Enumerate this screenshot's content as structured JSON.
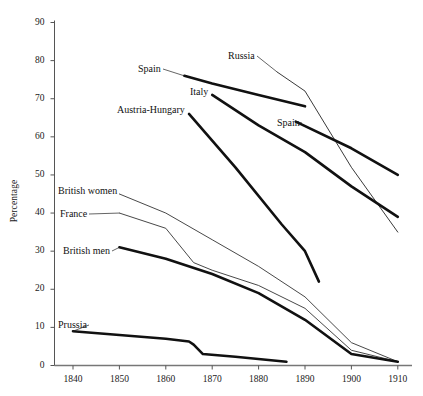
{
  "chart_data": {
    "type": "line",
    "title": "",
    "subtitle": "",
    "xlabel": "",
    "ylabel": "Percentage",
    "xlim": [
      1836,
      1912
    ],
    "ylim": [
      0,
      90
    ],
    "grid": false,
    "legend_position": "inline-labels",
    "x_ticks": [
      "1840",
      "1850",
      "1860",
      "1870",
      "1880",
      "1890",
      "1900",
      "1910"
    ],
    "y_ticks": [
      "0",
      "10",
      "20",
      "30",
      "40",
      "50",
      "60",
      "70",
      "80",
      "90"
    ],
    "series": [
      {
        "name": "Spain",
        "label": "Spain",
        "style": "thick",
        "color": "#111111",
        "label_pos": {
          "x": 138,
          "y": 64
        },
        "x": [
          1864,
          1870,
          1880,
          1890
        ],
        "values": [
          76,
          74,
          71,
          68
        ]
      },
      {
        "name": "Russia",
        "label": "Russia",
        "style": "thin",
        "color": "#222222",
        "label_pos": {
          "x": 228,
          "y": 51
        },
        "x": [
          1884,
          1890,
          1900,
          1910
        ],
        "values": [
          77,
          72,
          52,
          35
        ]
      },
      {
        "name": "Italy",
        "label": "Italy",
        "style": "thick",
        "color": "#111111",
        "label_pos": {
          "x": 190,
          "y": 87
        },
        "x": [
          1870,
          1880,
          1890,
          1900,
          1910
        ],
        "values": [
          71,
          63,
          56,
          47,
          39
        ]
      },
      {
        "name": "Spain",
        "label": "Spain",
        "style": "thick",
        "color": "#111111",
        "label_pos": {
          "x": 277,
          "y": 118
        },
        "x": [
          1888,
          1900,
          1910
        ],
        "values": [
          64,
          57,
          50
        ]
      },
      {
        "name": "Austria-Hungary",
        "label": "Austria-Hungary",
        "style": "thick",
        "color": "#111111",
        "label_pos": {
          "x": 117,
          "y": 105
        },
        "x": [
          1865,
          1875,
          1885,
          1890,
          1893
        ],
        "values": [
          66,
          52,
          37,
          30,
          22
        ]
      },
      {
        "name": "British women",
        "label": "British women",
        "style": "thin",
        "color": "#333333",
        "label_pos": {
          "x": 58,
          "y": 186
        },
        "x": [
          1850,
          1860,
          1870,
          1880,
          1890,
          1900,
          1910
        ],
        "values": [
          45,
          40,
          33,
          26,
          18,
          6,
          1
        ]
      },
      {
        "name": "France",
        "label": "France",
        "style": "thin",
        "color": "#333333",
        "label_pos": {
          "x": 60,
          "y": 209
        },
        "x": [
          1850,
          1860,
          1866,
          1870,
          1880,
          1890,
          1900,
          1910
        ],
        "values": [
          40,
          36,
          27,
          25,
          21,
          15,
          4,
          1
        ]
      },
      {
        "name": "British men",
        "label": "British men",
        "style": "thick",
        "color": "#111111",
        "label_pos": {
          "x": 63,
          "y": 246
        },
        "x": [
          1850,
          1860,
          1870,
          1880,
          1890,
          1900,
          1910
        ],
        "values": [
          31,
          28,
          24,
          19,
          12,
          3,
          1
        ]
      },
      {
        "name": "Prussia",
        "label": "Prussia",
        "style": "thick",
        "color": "#111111",
        "label_pos": {
          "x": 58,
          "y": 320
        },
        "x": [
          1840,
          1850,
          1860,
          1865,
          1866,
          1868,
          1875,
          1886
        ],
        "values": [
          9,
          8,
          7,
          6.3,
          5.5,
          3,
          2.3,
          1
        ]
      }
    ]
  }
}
